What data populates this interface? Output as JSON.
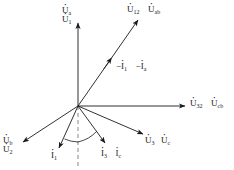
{
  "diagram": {
    "kind": "phasor-diagram",
    "title": "",
    "background_color": "#ffffff",
    "line_color": "#1a1a1a",
    "dashed_line_color": "#b0a8a8",
    "origin": {
      "x": 78,
      "y": 106
    },
    "vectors": [
      {
        "id": "u-a-u-1",
        "name": "U_a / U_1",
        "label_primary": "U",
        "label_primary_sub": "a",
        "label_secondary": "U",
        "label_secondary_sub": "1",
        "tip": {
          "x": 78,
          "y": 22
        },
        "arrow": true
      },
      {
        "id": "u-12-u-ab",
        "name": "U_12 / U_ab",
        "label_primary": "U",
        "label_primary_sub": "12",
        "label_secondary": "U",
        "label_secondary_sub": "ab",
        "tip": {
          "x": 139,
          "y": 19
        },
        "arrow": true
      },
      {
        "id": "u-32-u-cb",
        "name": "U_32 / U_cb",
        "label_primary": "U",
        "label_primary_sub": "32",
        "label_secondary": "U",
        "label_secondary_sub": "cb",
        "tip": {
          "x": 186,
          "y": 106
        },
        "arrow": true
      },
      {
        "id": "u-b-u-2",
        "name": "U_b / U_2",
        "label_primary": "U",
        "label_primary_sub": "b",
        "label_secondary": "U",
        "label_secondary_sub": "2",
        "tip": {
          "x": 21,
          "y": 143
        },
        "arrow": true
      },
      {
        "id": "u-3-u-c",
        "name": "U_3 / U_c",
        "label_primary": "U",
        "label_primary_sub": "3",
        "label_secondary": "U",
        "label_secondary_sub": "c",
        "tip": {
          "x": 144,
          "y": 135
        },
        "arrow": true
      },
      {
        "id": "i-1",
        "name": "I_1",
        "label_primary": "I",
        "label_primary_sub": "1",
        "label_secondary": "",
        "label_secondary_sub": "",
        "tip": {
          "x": 58,
          "y": 149
        },
        "arrow": true
      },
      {
        "id": "i-3-i-c",
        "name": "I_3 / I_c",
        "label_primary": "I",
        "label_primary_sub": "3",
        "label_secondary": "I",
        "label_secondary_sub": "c",
        "tip": {
          "x": 106,
          "y": 144
        },
        "arrow": true
      }
    ],
    "dashed_reference": {
      "id": "vertical-dashed-reference",
      "name": "vertical reference line",
      "from": {
        "x": 78,
        "y": 106
      },
      "to": {
        "x": 78,
        "y": 168
      }
    },
    "angle_arcs": [
      {
        "id": "angle-arc-left",
        "name": "phase angle between I_1 and reference"
      },
      {
        "id": "angle-arc-right",
        "name": "phase angle between reference and I_3"
      }
    ],
    "midline_label": {
      "id": "minus-i-1-minus-i-a",
      "minus": "−",
      "label_primary": "I",
      "label_primary_sub": "1",
      "label_secondary": "I",
      "label_secondary_sub": "a"
    }
  },
  "labels": {
    "top_left_stack": {
      "line1_symbol": "U",
      "line1_sub": "a",
      "line2_symbol": "U",
      "line2_sub": "1"
    },
    "top_right_row": {
      "item1_symbol": "U",
      "item1_sub": "12",
      "item2_symbol": "U",
      "item2_sub": "ab"
    },
    "mid_right_row": {
      "minus1": "−",
      "item1_symbol": "I",
      "item1_sub": "1",
      "minus2": "−",
      "item2_symbol": "I",
      "item2_sub": "a"
    },
    "right_row": {
      "item1_symbol": "U",
      "item1_sub": "32",
      "item2_symbol": "U",
      "item2_sub": "cb"
    },
    "bottom_left_stack": {
      "line1_symbol": "U",
      "line1_sub": "b",
      "line2_symbol": "U",
      "line2_sub": "2"
    },
    "bottom_i1": {
      "item1_symbol": "I",
      "item1_sub": "1"
    },
    "bottom_i3_ic": {
      "item1_symbol": "I",
      "item1_sub": "3",
      "item2_symbol": "I",
      "item2_sub": "c"
    },
    "bottom_right_row": {
      "item1_symbol": "U",
      "item1_sub": "3",
      "item2_symbol": "U",
      "item2_sub": "c"
    }
  }
}
